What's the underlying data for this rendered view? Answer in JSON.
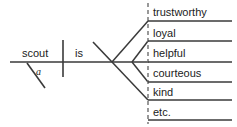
{
  "diagram": {
    "kind": "sentence-diagram",
    "stroke_color": "#3a3a3a",
    "dashed_color": "#6e6e6e",
    "text_color": "#1b1b1b",
    "background": "#ffffff",
    "subject": "scout",
    "subject_article": "a",
    "verb": "is",
    "predicate_complements": [
      "trustworthy",
      "loyal",
      "helpful",
      "courteous",
      "kind",
      "etc."
    ]
  }
}
